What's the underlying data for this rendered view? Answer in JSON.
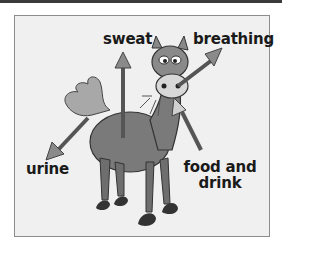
{
  "diagram": {
    "labels": {
      "sweat": "sweat",
      "breathing": "breathing",
      "urine": "urine",
      "food_line1": "food and",
      "food_line2": "drink"
    },
    "arrows": [
      {
        "name": "sweat-arrow",
        "direction": "out",
        "target": "sweat"
      },
      {
        "name": "breathing-arrow",
        "direction": "out",
        "target": "breathing"
      },
      {
        "name": "urine-arrow",
        "direction": "out",
        "target": "urine"
      },
      {
        "name": "food-drink-arrow",
        "direction": "in",
        "target": "food and drink"
      }
    ],
    "colors": {
      "frame_border": "#8c8c8c",
      "panel_bg": "#f0f0f0",
      "horse_body": "#7a7a7a",
      "arrow_fill": "#8a8a8a",
      "arrow_shaft": "#555555",
      "text": "#1a1a1a",
      "top_bar": "#3a3a3a"
    }
  }
}
